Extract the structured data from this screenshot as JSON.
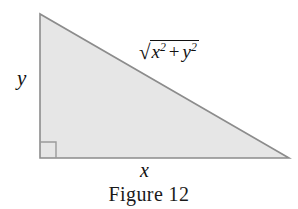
{
  "figure": {
    "caption": "Figure 12",
    "shape": "right-triangle",
    "colors": {
      "fill": "#e6e6e6",
      "stroke": "#8c8c8c",
      "text": "#111111",
      "background": "#ffffff"
    },
    "geometry": {
      "apex": [
        40,
        14
      ],
      "bottom_left": [
        40,
        158
      ],
      "bottom_right": [
        289,
        158
      ],
      "right_angle_marker_size": 16
    },
    "labels": {
      "vertical_leg": "y",
      "horizontal_leg": "x",
      "hypotenuse": {
        "radical": "√",
        "base_x": "x",
        "exp_x": "2",
        "operator": "+",
        "base_y": "y",
        "exp_y": "2",
        "full_text": "√(x² + y²)"
      }
    }
  }
}
